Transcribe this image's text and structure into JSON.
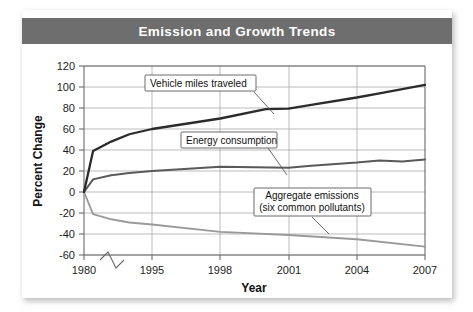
{
  "figure": {
    "title": "Emission and Growth Trends"
  },
  "chart_data": {
    "type": "line",
    "title": "Emission and Growth Trends",
    "xlabel": "Year",
    "ylabel": "Percent Change",
    "xlim": [
      1980,
      2007
    ],
    "ylim": [
      -60,
      120
    ],
    "grid": true,
    "axis_break": {
      "present": true,
      "between": [
        1980,
        1995
      ],
      "note": "zigzag break symbol on x-axis"
    },
    "legend_position": "inline annotations",
    "x_ticks": [
      "1980",
      "1995",
      "1998",
      "2001",
      "2004",
      "2007"
    ],
    "y_ticks": [
      "120",
      "100",
      "80",
      "60",
      "40",
      "20",
      "0",
      "-20",
      "-40",
      "-60"
    ],
    "series": [
      {
        "name": "Vehicle miles traveled",
        "color": "#2b2b2b",
        "x": [
          1980,
          1982,
          1986,
          1990,
          1995,
          1998,
          2000,
          2001,
          2002,
          2004,
          2005,
          2006,
          2007
        ],
        "values": [
          0,
          39,
          48,
          55,
          60,
          70,
          79,
          79.5,
          83,
          90,
          94,
          98,
          102
        ]
      },
      {
        "name": "Energy consumption",
        "color": "#595959",
        "x": [
          1980,
          1982,
          1986,
          1990,
          1995,
          1998,
          2001,
          2002,
          2004,
          2005,
          2006,
          2007
        ],
        "values": [
          0,
          12,
          16,
          18,
          20,
          24,
          23,
          25,
          28,
          30,
          29,
          31
        ]
      },
      {
        "name": "Aggregate emissions (six common pollutants)",
        "color": "#9a9a9a",
        "x": [
          1980,
          1982,
          1986,
          1990,
          1995,
          1998,
          2001,
          2004,
          2007
        ],
        "values": [
          0,
          -21,
          -26,
          -29,
          -31,
          -38,
          -41,
          -45,
          -52
        ]
      }
    ],
    "annotations": [
      {
        "id": "vehicle",
        "lines": [
          "Vehicle miles traveled"
        ]
      },
      {
        "id": "energy",
        "lines": [
          "Energy consumption"
        ]
      },
      {
        "id": "emissions",
        "lines": [
          "Aggregate emissions",
          "(six common pollutants)"
        ]
      }
    ]
  }
}
